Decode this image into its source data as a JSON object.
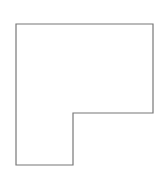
{
  "diagram": {
    "type": "outline-shape",
    "shape": "L-shape",
    "canvas": {
      "width": 164,
      "height": 183,
      "background": "#ffffff"
    },
    "stroke_color": "#777777",
    "stroke_width": 1.2,
    "fill": "#ffffff",
    "vertices": [
      [
        16,
        24
      ],
      [
        153,
        24
      ],
      [
        153,
        113
      ],
      [
        73,
        113
      ],
      [
        73,
        165
      ],
      [
        16,
        165
      ]
    ]
  }
}
